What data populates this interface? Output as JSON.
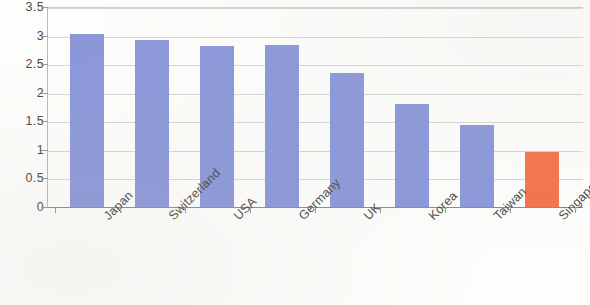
{
  "chart_data": {
    "type": "bar",
    "title": "",
    "xlabel": "",
    "ylabel": "",
    "categories": [
      "Japan",
      "Switzerland",
      "USA",
      "Germany",
      "UK",
      "Korea",
      "Taiwan",
      "Singapore"
    ],
    "values": [
      3.03,
      2.93,
      2.82,
      2.84,
      2.34,
      1.8,
      1.44,
      0.96
    ],
    "ylim": [
      0,
      3.5
    ],
    "ytick_labels": [
      "3.5",
      "3",
      "2.5",
      "2",
      "1.5",
      "1",
      "0.5",
      "0"
    ],
    "ytick_values": [
      3.5,
      3,
      2.5,
      2,
      1.5,
      1,
      0.5,
      0
    ],
    "grid": "horizontal",
    "legend": "none",
    "bar_colors": [
      "#8b97d9",
      "#8b97d9",
      "#8b97d9",
      "#8b97d9",
      "#8b97d9",
      "#8b97d9",
      "#8b97d9",
      "#f4744a"
    ],
    "series": [
      {
        "name": "",
        "values": [
          3.03,
          2.93,
          2.82,
          2.84,
          2.34,
          1.8,
          1.44,
          0.96
        ]
      }
    ]
  },
  "colors": {
    "bar_blue": "#8b97d9",
    "bar_orange": "#f4744a",
    "gridline": "#d6d6d6",
    "axis": "#8c8c8c",
    "text": "#4a4a4a",
    "background": "#fdfdfb"
  }
}
